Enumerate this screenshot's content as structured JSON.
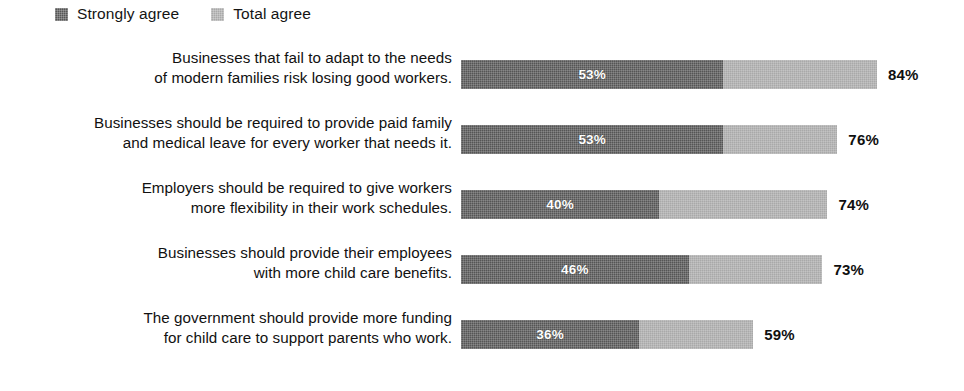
{
  "legend": {
    "items": [
      {
        "label": "Strongly agree",
        "color": "#555555",
        "icon": "square-swatch-icon"
      },
      {
        "label": "Total agree",
        "color": "#a9a9a9",
        "icon": "square-swatch-icon"
      }
    ]
  },
  "colors": {
    "strongly_agree": "#555555",
    "total_agree": "#a9a9a9",
    "background": "#ffffff",
    "text": "#111111",
    "bar_value_text": "#ffffff"
  },
  "scale": {
    "px_per_percent": 4.952,
    "axis_max": 100
  },
  "rows": [
    {
      "label_line1": "Businesses that fail to adapt to the needs",
      "label_line2": "of modern families risk losing good workers.",
      "strongly_agree_label": "53%",
      "total_agree_label": "84%",
      "strongly_agree": 53,
      "total_agree": 84
    },
    {
      "label_line1": "Businesses should be required to provide paid family",
      "label_line2": "and medical leave for every worker that needs it.",
      "strongly_agree_label": "53%",
      "total_agree_label": "76%",
      "strongly_agree": 53,
      "total_agree": 76
    },
    {
      "label_line1": "Employers should be required to give workers",
      "label_line2": "more flexibility in their work schedules.",
      "strongly_agree_label": "40%",
      "total_agree_label": "74%",
      "strongly_agree": 40,
      "total_agree": 74
    },
    {
      "label_line1": "Businesses should provide their employees",
      "label_line2": "with more child care benefits.",
      "strongly_agree_label": "46%",
      "total_agree_label": "73%",
      "strongly_agree": 46,
      "total_agree": 73
    },
    {
      "label_line1": "The government should provide more funding",
      "label_line2": "for child care to support parents who work.",
      "strongly_agree_label": "36%",
      "total_agree_label": "59%",
      "strongly_agree": 36,
      "total_agree": 59
    }
  ],
  "chart_data": {
    "type": "bar",
    "title": "",
    "xlabel": "",
    "ylabel": "",
    "orientation": "horizontal",
    "stacked": true,
    "grid": false,
    "legend_position": "top-left",
    "xlim": [
      0,
      100
    ],
    "categories": [
      "Businesses that fail to adapt to the needs of modern families risk losing good workers.",
      "Businesses should be required to provide paid family and medical leave for every worker that needs it.",
      "Employers should be required to give workers more flexibility in their work schedules.",
      "Businesses should provide their employees with more child care benefits.",
      "The government should provide more funding for child care to support parents who work."
    ],
    "series": [
      {
        "name": "Strongly agree",
        "values": [
          53,
          53,
          40,
          46,
          36
        ],
        "color": "#555555"
      },
      {
        "name": "Total agree",
        "values": [
          84,
          76,
          74,
          73,
          59
        ],
        "color": "#a9a9a9"
      }
    ],
    "data_labels": {
      "Strongly agree": [
        "53%",
        "53%",
        "40%",
        "46%",
        "36%"
      ],
      "Total agree": [
        "84%",
        "76%",
        "74%",
        "73%",
        "59%"
      ]
    }
  }
}
